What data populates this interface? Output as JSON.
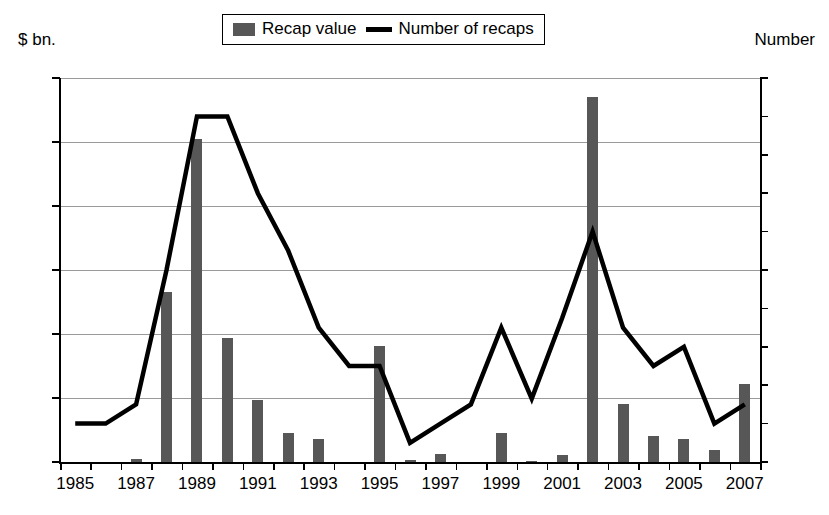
{
  "left_axis_title": "$ bn.",
  "right_axis_title": "Number",
  "legend": {
    "bar_label": "Recap value",
    "line_label": "Number of recaps",
    "bar_color": "#575757",
    "line_color": "#000000"
  },
  "chart_data": {
    "type": "bar",
    "title": "",
    "subtitle": "",
    "xlabel": "",
    "ylabel": "$ bn.",
    "y2label": "Number",
    "grid": true,
    "legend_position": "top-center",
    "ylim": [
      0,
      6
    ],
    "y2lim": [
      0,
      20
    ],
    "yticks": [
      "0",
      "1",
      "2",
      "3",
      "4",
      "5",
      "6"
    ],
    "y2ticks": [
      "0",
      "2",
      "4",
      "6",
      "8",
      "10",
      "12",
      "14",
      "16",
      "18",
      "20"
    ],
    "categories": [
      "1985",
      "1986",
      "1987",
      "1988",
      "1989",
      "1990",
      "1991",
      "1992",
      "1993",
      "1994",
      "1995",
      "1996",
      "1997",
      "1998",
      "1999",
      "2000",
      "2001",
      "2002",
      "2003",
      "2004",
      "2005",
      "2006",
      "2007"
    ],
    "xtick_labels": [
      "1985",
      "",
      "1987",
      "",
      "1989",
      "",
      "1991",
      "",
      "1993",
      "",
      "1995",
      "",
      "1997",
      "",
      "1999",
      "",
      "2001",
      "",
      "2003",
      "",
      "2005",
      "",
      "2007"
    ],
    "series": [
      {
        "name": "Recap value",
        "type": "bar",
        "axis": "left",
        "unit": "$ bn.",
        "color": "#575757",
        "values": [
          0,
          0,
          0.04,
          2.65,
          5.05,
          1.93,
          0.97,
          0.46,
          0.36,
          0,
          1.82,
          0.03,
          0.12,
          0,
          0.45,
          0.02,
          0.11,
          5.7,
          0.91,
          0.4,
          0.36,
          0.19,
          1.22
        ]
      },
      {
        "name": "Number of recaps",
        "type": "line",
        "axis": "right",
        "unit": "Number",
        "color": "#000000",
        "values": [
          2,
          2,
          3,
          10,
          18,
          18,
          14,
          11,
          7,
          5,
          5,
          1,
          2,
          3,
          7,
          3.3,
          7.5,
          12,
          7,
          5,
          6,
          2,
          3
        ]
      }
    ]
  }
}
